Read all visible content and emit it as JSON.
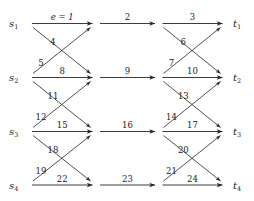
{
  "diagram": {
    "type": "network-flow-graph",
    "background_color": "#ffffff",
    "line_color": "#262626",
    "rows": 4,
    "columns": 3,
    "sources": [
      {
        "id": "s1",
        "base": "s",
        "sub": "1"
      },
      {
        "id": "s2",
        "base": "s",
        "sub": "2"
      },
      {
        "id": "s3",
        "base": "s",
        "sub": "3"
      },
      {
        "id": "s4",
        "base": "s",
        "sub": "4"
      }
    ],
    "terminals": [
      {
        "id": "t1",
        "base": "t",
        "sub": "1"
      },
      {
        "id": "t2",
        "base": "t",
        "sub": "2"
      },
      {
        "id": "t3",
        "base": "t",
        "sub": "3"
      },
      {
        "id": "t4",
        "base": "t",
        "sub": "4"
      }
    ],
    "horizontal_edges": [
      {
        "row": 1,
        "col": 1,
        "label": "e = 1",
        "italic": true
      },
      {
        "row": 1,
        "col": 2,
        "label": "2",
        "italic": false
      },
      {
        "row": 1,
        "col": 3,
        "label": "3",
        "italic": false
      },
      {
        "row": 2,
        "col": 1,
        "label": "8",
        "italic": false
      },
      {
        "row": 2,
        "col": 2,
        "label": "9",
        "italic": false
      },
      {
        "row": 2,
        "col": 3,
        "label": "10",
        "italic": false
      },
      {
        "row": 3,
        "col": 1,
        "label": "15",
        "italic": false
      },
      {
        "row": 3,
        "col": 2,
        "label": "16",
        "italic": false
      },
      {
        "row": 3,
        "col": 3,
        "label": "17",
        "italic": false
      },
      {
        "row": 4,
        "col": 1,
        "label": "22",
        "italic": false
      },
      {
        "row": 4,
        "col": 2,
        "label": "23",
        "italic": false
      },
      {
        "row": 4,
        "col": 3,
        "label": "24",
        "italic": false
      }
    ],
    "diagonal_edges": [
      {
        "from_row": 1,
        "to_row": 2,
        "col": 1,
        "direction": "down",
        "label": "4"
      },
      {
        "from_row": 2,
        "to_row": 1,
        "col": 1,
        "direction": "up",
        "label": "5"
      },
      {
        "from_row": 1,
        "to_row": 2,
        "col": 3,
        "direction": "down",
        "label": "6"
      },
      {
        "from_row": 2,
        "to_row": 1,
        "col": 3,
        "direction": "up",
        "label": "7"
      },
      {
        "from_row": 2,
        "to_row": 3,
        "col": 1,
        "direction": "down",
        "label": "11"
      },
      {
        "from_row": 3,
        "to_row": 2,
        "col": 1,
        "direction": "up",
        "label": "12"
      },
      {
        "from_row": 2,
        "to_row": 3,
        "col": 3,
        "direction": "down",
        "label": "13"
      },
      {
        "from_row": 3,
        "to_row": 2,
        "col": 3,
        "direction": "up",
        "label": "14"
      },
      {
        "from_row": 3,
        "to_row": 4,
        "col": 1,
        "direction": "down",
        "label": "18"
      },
      {
        "from_row": 4,
        "to_row": 3,
        "col": 1,
        "direction": "up",
        "label": "19"
      },
      {
        "from_row": 3,
        "to_row": 4,
        "col": 3,
        "direction": "down",
        "label": "20"
      },
      {
        "from_row": 4,
        "to_row": 3,
        "col": 3,
        "direction": "up",
        "label": "21"
      }
    ]
  }
}
